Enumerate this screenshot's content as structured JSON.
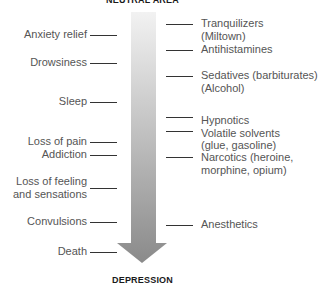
{
  "diagram": {
    "top_label": "NEUTRAL AREA",
    "bottom_label": "DEPRESSION",
    "arrow": {
      "direction": "down",
      "gradient_top": "#f0f0f0",
      "gradient_bottom": "#8a8a8a"
    },
    "effects": [
      {
        "label": "Anxiety relief"
      },
      {
        "label": "Drowsiness"
      },
      {
        "label": "Sleep"
      },
      {
        "label": "Loss of pain"
      },
      {
        "label": "Addiction"
      },
      {
        "label": "Loss of feeling",
        "label2": "and sensations"
      },
      {
        "label": "Convulsions"
      },
      {
        "label": "Death"
      }
    ],
    "drugs": [
      {
        "label": "Tranquilizers",
        "label2": "(Miltown)"
      },
      {
        "label": "Antihistamines"
      },
      {
        "label": "Sedatives (barbiturates)",
        "label2": "(Alcohol)"
      },
      {
        "label": "Hypnotics"
      },
      {
        "label": "Volatile solvents",
        "label2": "(glue, gasoline)"
      },
      {
        "label": "Narcotics (heroine,",
        "label2": "morphine, opium)"
      },
      {
        "label": "Anesthetics"
      }
    ]
  }
}
